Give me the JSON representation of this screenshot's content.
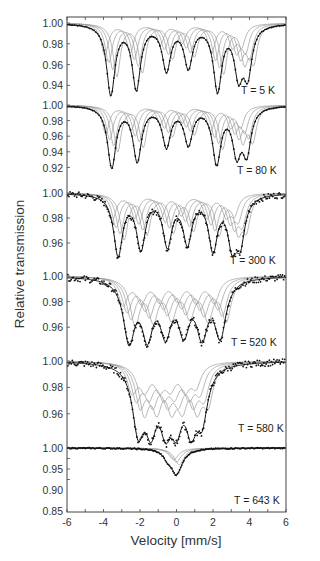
{
  "chart_data": {
    "type": "line",
    "title": "",
    "xlabel": "Velocity [mm/s]",
    "ylabel": "Relative transmission",
    "xlim": [
      -6,
      6
    ],
    "xticks": [
      -6,
      -4,
      -2,
      0,
      2,
      4,
      6
    ],
    "grid": false,
    "legend": "none",
    "layout": "six vertically stacked panels sharing x-axis; black dots = measured data, black line = total fit, grey lines = fitted subspectra",
    "panels": [
      {
        "label": "T = 5 K",
        "ylim": [
          0.925,
          1.005
        ],
        "yticks": [
          "1.00",
          "0.98",
          "0.96",
          "0.94"
        ],
        "dip_positions": [
          -3.6,
          -2.2,
          -0.55,
          0.65,
          2.25,
          3.4,
          3.9
        ],
        "dip_depths": [
          0.933,
          0.939,
          0.957,
          0.96,
          0.938,
          0.955,
          0.955
        ],
        "subspectra": 4
      },
      {
        "label": "T = 80 K",
        "ylim": [
          0.915,
          1.005
        ],
        "yticks": [
          "1.00",
          "0.98",
          "0.96",
          "0.94",
          "0.92"
        ],
        "dip_positions": [
          -3.55,
          -2.15,
          -0.55,
          0.65,
          2.2,
          3.3,
          3.85
        ],
        "dip_depths": [
          0.922,
          0.931,
          0.95,
          0.953,
          0.929,
          0.944,
          0.944
        ],
        "subspectra": 4
      },
      {
        "label": "T = 300 K",
        "ylim": [
          0.945,
          1.005
        ],
        "yticks": [
          "1.00",
          "0.98",
          "0.96"
        ],
        "dip_positions": [
          -3.2,
          -1.95,
          -0.5,
          0.6,
          2.0,
          3.05,
          3.5
        ],
        "dip_depths": [
          0.952,
          0.958,
          0.961,
          0.963,
          0.958,
          0.964,
          0.966
        ],
        "subspectra": 4
      },
      {
        "label": "T = 520 K",
        "ylim": [
          0.945,
          1.005
        ],
        "yticks": [
          "1.00",
          "0.98",
          "0.96"
        ],
        "dip_positions": [
          -2.6,
          -1.6,
          -0.6,
          0.4,
          1.4,
          2.4
        ],
        "dip_depths": [
          0.953,
          0.959,
          0.962,
          0.963,
          0.96,
          0.957
        ],
        "subspectra": 4
      },
      {
        "label": "T = 580 K",
        "ylim": [
          0.945,
          1.005
        ],
        "yticks": [
          "1.00",
          "0.98",
          "0.96"
        ],
        "dip_positions": [
          -2.1,
          -1.4,
          -0.6,
          0.0,
          0.8,
          1.4
        ],
        "dip_depths": [
          0.953,
          0.96,
          0.962,
          0.963,
          0.96,
          0.963
        ],
        "subspectra": 4
      },
      {
        "label": "T = 643 K",
        "ylim": [
          0.85,
          1.01
        ],
        "yticks": [
          "1.00",
          "0.95",
          "0.90",
          "0.85"
        ],
        "dip_positions": [
          0.0
        ],
        "dip_depths": [
          0.878
        ],
        "shoulder": {
          "position": -0.5,
          "value": 0.905
        },
        "subspectra": 3
      }
    ]
  },
  "axes": {
    "x_label": "Velocity [mm/s]",
    "y_label": "Relative transmission",
    "x_ticks": [
      "-6",
      "-4",
      "-2",
      "0",
      "2",
      "4",
      "6"
    ]
  },
  "panels": [
    {
      "label": "T = 5 K",
      "ticks": [
        "1.00",
        "0.98",
        "0.96",
        "0.94"
      ]
    },
    {
      "label": "T = 80 K",
      "ticks": [
        "1.00",
        "0.98",
        "0.96",
        "0.94",
        "0.92"
      ]
    },
    {
      "label": "T = 300 K",
      "ticks": [
        "1.00",
        "0.98",
        "0.96"
      ]
    },
    {
      "label": "T = 520 K",
      "ticks": [
        "1.00",
        "0.98",
        "0.96"
      ]
    },
    {
      "label": "T = 580 K",
      "ticks": [
        "1.00",
        "0.98",
        "0.96"
      ]
    },
    {
      "label": "T = 643 K",
      "ticks": [
        "1.00",
        "0.95",
        "0.90",
        "0.85"
      ]
    }
  ]
}
